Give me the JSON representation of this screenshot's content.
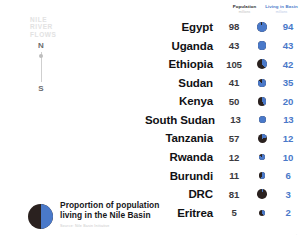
{
  "map": {
    "nile_label": "NILE\nRIVER\nFLOWS",
    "compass_north": "N",
    "compass_south": "S"
  },
  "legend": {
    "line1": "Proportion of population",
    "line2": "living in the Nile Basin",
    "source": "Source: Nile Basin Initiative",
    "swatch_basin_color": "#4a79c9",
    "swatch_rest_color": "#2a211f"
  },
  "table": {
    "headers": [
      {
        "title": "Population",
        "subtitle": "millions"
      },
      {
        "title": "Living in Basin",
        "subtitle": "millions"
      }
    ],
    "rows": [
      {
        "country": "Egypt",
        "population": "98",
        "basin": "94",
        "pct": 96,
        "size": 10.0
      },
      {
        "country": "Uganda",
        "population": "43",
        "basin": "43",
        "pct": 100,
        "size": 8.4
      },
      {
        "country": "Ethiopia",
        "population": "105",
        "basin": "42",
        "pct": 40,
        "size": 10.2
      },
      {
        "country": "Sudan",
        "population": "41",
        "basin": "35",
        "pct": 85,
        "size": 8.3
      },
      {
        "country": "Kenya",
        "population": "50",
        "basin": "20",
        "pct": 40,
        "size": 8.8
      },
      {
        "country": "South Sudan",
        "population": "13",
        "basin": "13",
        "pct": 100,
        "size": 7.0
      },
      {
        "country": "Tanzania",
        "population": "57",
        "basin": "12",
        "pct": 21,
        "size": 9.0
      },
      {
        "country": "Rwanda",
        "population": "12",
        "basin": "10",
        "pct": 83,
        "size": 6.8
      },
      {
        "country": "Burundi",
        "population": "11",
        "basin": "6",
        "pct": 55,
        "size": 6.6
      },
      {
        "country": "DRC",
        "population": "81",
        "basin": "3",
        "pct": 4,
        "size": 9.6
      },
      {
        "country": "Eritrea",
        "population": "5",
        "basin": "2",
        "pct": 40,
        "size": 6.2
      }
    ]
  },
  "corner_mark": "·",
  "chart_data": {
    "type": "table",
    "title": "Proportion of population living in the Nile Basin",
    "categories": [
      "Egypt",
      "Uganda",
      "Ethiopia",
      "Sudan",
      "Kenya",
      "South Sudan",
      "Tanzania",
      "Rwanda",
      "Burundi",
      "DRC",
      "Eritrea"
    ],
    "series": [
      {
        "name": "Population",
        "unit": "millions",
        "values": [
          98,
          43,
          105,
          41,
          50,
          13,
          57,
          12,
          11,
          81,
          5
        ]
      },
      {
        "name": "Living in Basin",
        "unit": "millions",
        "values": [
          94,
          43,
          42,
          35,
          20,
          13,
          12,
          10,
          6,
          3,
          2
        ]
      },
      {
        "name": "Share in Basin",
        "unit": "percent",
        "values": [
          96,
          100,
          40,
          85,
          40,
          100,
          21,
          83,
          55,
          4,
          40
        ]
      }
    ],
    "xlabel": "",
    "ylabel": "",
    "legend": "bottom-left",
    "grid": false
  }
}
